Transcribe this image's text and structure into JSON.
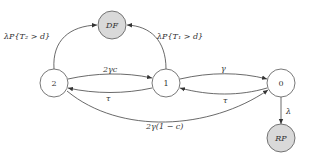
{
  "diagram": {
    "type": "state-transition",
    "nodes": [
      {
        "id": "DF",
        "label": "DF",
        "absorbing": true,
        "fill": "#d9d9d9"
      },
      {
        "id": "2",
        "label": "2",
        "absorbing": false,
        "fill": "#ffffff"
      },
      {
        "id": "1",
        "label": "1",
        "absorbing": false,
        "fill": "#ffffff"
      },
      {
        "id": "0",
        "label": "0",
        "absorbing": false,
        "fill": "#ffffff"
      },
      {
        "id": "RP",
        "label": "RP",
        "absorbing": true,
        "fill": "#d9d9d9"
      }
    ],
    "edges": {
      "e2_DF": {
        "from": "2",
        "to": "DF",
        "label": "λP{T₂ > d}"
      },
      "e1_DF": {
        "from": "1",
        "to": "DF",
        "label": "λP{T₁ > d}"
      },
      "e2_1": {
        "from": "2",
        "to": "1",
        "label": "2γc"
      },
      "e1_2": {
        "from": "1",
        "to": "2",
        "label": "τ"
      },
      "e1_0": {
        "from": "1",
        "to": "0",
        "label": "γ"
      },
      "e0_1": {
        "from": "0",
        "to": "1",
        "label": "τ"
      },
      "e2_0": {
        "from": "2",
        "to": "0",
        "label": "2γ(1 − c)"
      },
      "e0_RP": {
        "from": "0",
        "to": "RP",
        "label": "λ"
      }
    }
  }
}
